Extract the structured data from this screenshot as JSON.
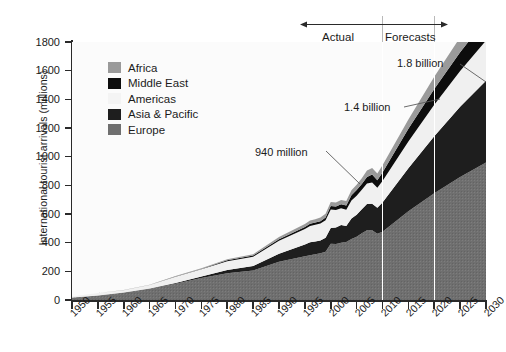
{
  "chart_data": {
    "type": "area",
    "stacked": true,
    "title": "",
    "xlabel": "",
    "ylabel": "International tourist arrivals (millions)",
    "ylim": [
      0,
      1800
    ],
    "xlim": [
      1950,
      2030
    ],
    "yticks": [
      0,
      200,
      400,
      600,
      800,
      1000,
      1200,
      1400,
      1600,
      1800
    ],
    "xticks": [
      "1950",
      "1955",
      "1960",
      "1965",
      "1970",
      "1975",
      "1980",
      "1985",
      "1990",
      "1995",
      "2000",
      "2005",
      "2010",
      "2015",
      "2020",
      "2025",
      "2030"
    ],
    "grid": false,
    "legend_position": "inside-upper-left",
    "x": [
      1950,
      1955,
      1960,
      1965,
      1970,
      1975,
      1980,
      1985,
      1990,
      1995,
      1996,
      1997,
      1998,
      1999,
      2000,
      2001,
      2002,
      2003,
      2004,
      2005,
      2006,
      2007,
      2008,
      2009,
      2010,
      2015,
      2020,
      2025,
      2030
    ],
    "series": [
      {
        "name": "Europe",
        "color": "#6f6f6f",
        "values": [
          17,
          30,
          50,
          78,
          113,
          154,
          186,
          205,
          266,
          305,
          313,
          320,
          327,
          337,
          393,
          391,
          399,
          404,
          425,
          441,
          466,
          487,
          487,
          462,
          476,
          620,
          744,
          858,
          960
        ]
      },
      {
        "name": "Asia & Pacific",
        "color": "#1e1e1e",
        "values": [
          0.2,
          1,
          2,
          3,
          6,
          10,
          23,
          32,
          56,
          82,
          90,
          89,
          88,
          98,
          110,
          115,
          124,
          113,
          144,
          154,
          167,
          182,
          184,
          181,
          204,
          300,
          398,
          490,
          570
        ]
      },
      {
        "name": "Americas",
        "color": "#f0f0f0",
        "values": [
          7,
          17,
          16,
          23,
          43,
          50,
          62,
          65,
          92,
          109,
          114,
          116,
          119,
          122,
          128,
          122,
          117,
          113,
          126,
          133,
          136,
          143,
          148,
          140,
          150,
          185,
          220,
          250,
          280
        ]
      },
      {
        "name": "Middle East",
        "color": "#0d0d0d",
        "values": [
          0.2,
          0.6,
          0.6,
          1,
          2,
          3,
          7,
          8,
          10,
          14,
          15,
          15,
          16,
          18,
          25,
          24,
          28,
          30,
          36,
          39,
          41,
          47,
          56,
          53,
          60,
          90,
          110,
          130,
          149
        ]
      },
      {
        "name": "Africa",
        "color": "#9a9a9a",
        "values": [
          0.5,
          0.8,
          0.8,
          1,
          3,
          5,
          7,
          9,
          15,
          20,
          22,
          23,
          25,
          27,
          28,
          29,
          30,
          31,
          34,
          37,
          40,
          45,
          46,
          46,
          50,
          64,
          85,
          105,
          134
        ]
      }
    ],
    "annotations": [
      {
        "id": "actual",
        "label": "Actual",
        "x": 1995
      },
      {
        "id": "forecasts",
        "label": "Forecasts",
        "x": 2022
      },
      {
        "id": "a940",
        "label": "940 million",
        "x": 2010,
        "y": 940
      },
      {
        "id": "a14",
        "label": "1.4 billion",
        "x": 2020,
        "y": 1400
      },
      {
        "id": "a18",
        "label": "1.8 billion",
        "x": 2030,
        "y": 1800
      }
    ],
    "dividers": [
      {
        "id": "divider-2010",
        "x": 2010
      },
      {
        "id": "divider-2020",
        "x": 2020
      }
    ]
  },
  "legend": {
    "items": [
      {
        "label": "Africa",
        "color": "#9a9a9a"
      },
      {
        "label": "Middle East",
        "color": "#0d0d0d"
      },
      {
        "label": "Americas",
        "color": "#f0f0f0"
      },
      {
        "label": "Asia & Pacific",
        "color": "#1e1e1e"
      },
      {
        "label": "Europe",
        "color": "#6f6f6f"
      }
    ]
  },
  "axis": {
    "y_title": "International tourist arrivals (millions)",
    "y_labels": [
      "1800",
      "1600",
      "1400",
      "1200",
      "1000",
      "800",
      "600",
      "400",
      "200",
      "0"
    ],
    "x_labels": [
      "1950",
      "1955",
      "1960",
      "1965",
      "1970",
      "1975",
      "1980",
      "1985",
      "1990",
      "1995",
      "2000",
      "2005",
      "2010",
      "2015",
      "2020",
      "2025",
      "2030"
    ]
  },
  "annotations": {
    "actual": "Actual",
    "forecasts": "Forecasts",
    "v940": "940 million",
    "v14": "1.4 billion",
    "v18": "1.8 billion"
  }
}
